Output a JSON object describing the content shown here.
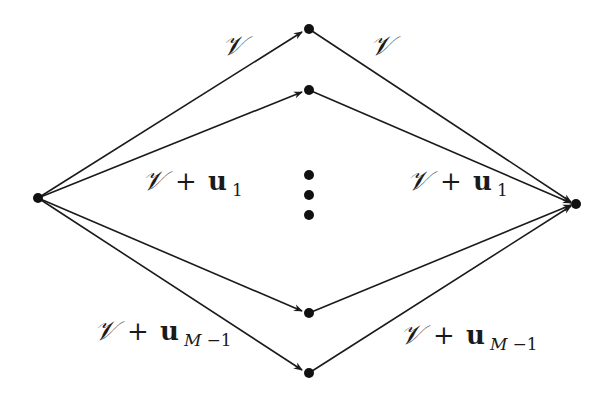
{
  "diagram": {
    "type": "directed-graph",
    "nodes": [
      {
        "id": "source",
        "x": 38,
        "y": 198
      },
      {
        "id": "mid1",
        "x": 309,
        "y": 29
      },
      {
        "id": "mid2",
        "x": 309,
        "y": 90
      },
      {
        "id": "midM-1",
        "x": 309,
        "y": 313
      },
      {
        "id": "midM",
        "x": 309,
        "y": 373
      },
      {
        "id": "sink",
        "x": 576,
        "y": 204
      }
    ],
    "ellipsis_dots": [
      {
        "x": 309,
        "y": 175
      },
      {
        "x": 309,
        "y": 195
      },
      {
        "x": 309,
        "y": 215
      }
    ],
    "labels": {
      "top_left": {
        "script": "𝒱"
      },
      "top_right": {
        "script": "𝒱"
      },
      "second_left": {
        "script": "𝒱",
        "plus": "+",
        "vec": "u",
        "sub": "1"
      },
      "second_right": {
        "script": "𝒱",
        "plus": "+",
        "vec": "u",
        "sub": "1"
      },
      "bottom_left": {
        "script": "𝒱",
        "plus": "+",
        "vec": "u",
        "sub_var": "M",
        "sub_rest": "−1"
      },
      "bottom_right": {
        "script": "𝒱",
        "plus": "+",
        "vec": "u",
        "sub_var": "M",
        "sub_rest": "−1"
      }
    },
    "colors": {
      "stroke": "#1a1a1a",
      "node": "#111111",
      "background": "#ffffff"
    }
  }
}
